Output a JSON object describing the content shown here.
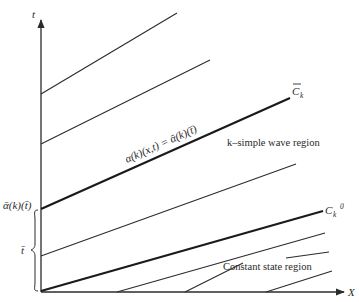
{
  "diagram": {
    "axes": {
      "x_label": "X",
      "y_label": "t"
    },
    "labels": {
      "characteristic_bar": "C",
      "characteristic_bar_sub": "k",
      "characteristic_zero": "C",
      "characteristic_zero_sub": "k",
      "characteristic_zero_sup": "0",
      "invariant_equation": "α(k)(x,t) = ᾱ(k)(t̄)",
      "k_simple_wave_region": "k–simple wave region",
      "constant_state_region": "Constant state region",
      "axis_value_alpha": "ᾱ(k)(t̄)",
      "axis_value_tbar": "t̄"
    },
    "colors": {
      "line": "#2b2b2b",
      "background": "#ffffff"
    }
  }
}
